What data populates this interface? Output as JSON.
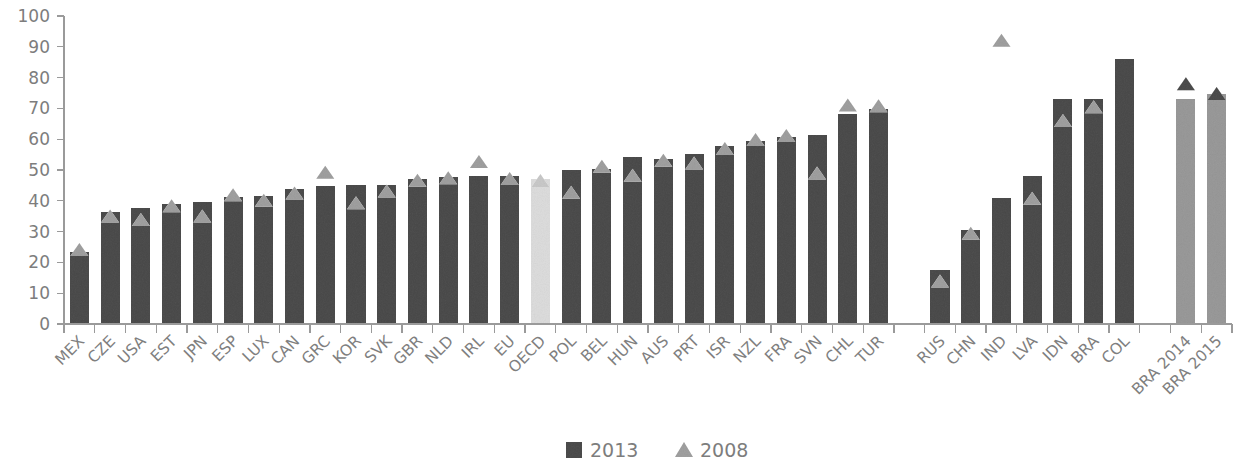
{
  "chart_data": {
    "type": "bar",
    "title": "",
    "subtitle": "",
    "xlabel": "",
    "ylabel": "",
    "ylim": [
      0,
      100
    ],
    "ytick_step": 10,
    "yticks": [
      0,
      10,
      20,
      30,
      40,
      50,
      60,
      70,
      80,
      90,
      100
    ],
    "grid": false,
    "legend_position": "bottom-center",
    "categories": [
      "MEX",
      "CZE",
      "USA",
      "EST",
      "JPN",
      "ESP",
      "LUX",
      "CAN",
      "GRC",
      "KOR",
      "SVK",
      "GBR",
      "NLD",
      "IRL",
      "EU",
      "OECD",
      "POL",
      "BEL",
      "HUN",
      "AUS",
      "PRT",
      "ISR",
      "NZL",
      "FRA",
      "SVN",
      "CHL",
      "TUR",
      "",
      "RUS",
      "CHN",
      "IND",
      "LVA",
      "IDN",
      "BRA",
      "COL",
      "",
      "BRA 2014",
      "BRA 2015"
    ],
    "series": [
      {
        "name": "2013",
        "marker": "square",
        "color": "#8a8a8a",
        "values": [
          23.5,
          36.4,
          37.6,
          38.8,
          39.5,
          41.2,
          41.4,
          43.8,
          44.7,
          45.2,
          45.2,
          47.1,
          47.6,
          47.9,
          47.9,
          47.0,
          50.1,
          50.3,
          54.1,
          53.6,
          55.3,
          57.7,
          59.4,
          60.6,
          61.3,
          68.2,
          69.8,
          null,
          17.6,
          30.6,
          41.0,
          48.2,
          72.9,
          73.1,
          86.0,
          null,
          73.0,
          74.8
        ]
      },
      {
        "name": "2008",
        "marker": "triangle",
        "color": "#c9c9c9",
        "values": [
          24.2,
          35.1,
          33.9,
          38.4,
          35.1,
          42.0,
          40.2,
          42.5,
          49.3,
          39.4,
          43.2,
          46.7,
          47.5,
          52.8,
          47.2,
          46.6,
          42.8,
          51.2,
          48.3,
          53.2,
          52.3,
          57.0,
          59.9,
          61.2,
          49.0,
          71.1,
          70.9,
          null,
          14.0,
          29.5,
          92.1,
          40.8,
          66.1,
          70.5,
          null,
          null,
          78.0,
          74.8
        ]
      }
    ],
    "highlight": {
      "category": "OECD",
      "color": "#ededed",
      "marker_color": "#e2e2e2"
    },
    "special_bars": {
      "categories": [
        "BRA 2014",
        "BRA 2015"
      ],
      "bar_color": "#c5c5c5",
      "marker_color": "#8a8a8a"
    },
    "legend": [
      {
        "label": "2013",
        "marker": "square",
        "color": "#8a8a8a"
      },
      {
        "label": "2008",
        "marker": "triangle",
        "color": "#c9c9c9"
      }
    ],
    "axis_color": "#9a9a9a",
    "text_color": "#7d7d7d",
    "label_rotation_deg": -45
  }
}
